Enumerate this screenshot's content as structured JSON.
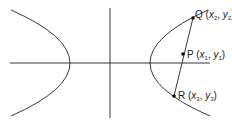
{
  "diagram": {
    "colors": {
      "stroke": "#222222",
      "background": "#ffffff"
    },
    "axes": {
      "x_axis": {
        "x1": 10,
        "y1": 63,
        "x2": 210,
        "y2": 63
      },
      "y_axis": {
        "x1": 110,
        "y1": 8,
        "x2": 110,
        "y2": 118
      }
    },
    "points": [
      {
        "id": "Q",
        "name": "Q",
        "sub_x": "2",
        "sub_y": "2",
        "cx": 193,
        "cy": 18,
        "label_x": 195,
        "label_y": 13
      },
      {
        "id": "P",
        "name": "P",
        "sub_x": "1",
        "sub_y": "1",
        "cx": 183,
        "cy": 54,
        "label_x": 187,
        "label_y": 50
      },
      {
        "id": "R",
        "name": "R",
        "sub_x": "3",
        "sub_y": "3",
        "cx": 174,
        "cy": 96,
        "label_x": 178,
        "label_y": 91
      }
    ],
    "labels": {
      "Q": {
        "letter": "Q",
        "open": " (",
        "x": "x",
        "sx": "2",
        "comma": ", ",
        "y": "y",
        "sy": "2",
        "close": ")"
      },
      "P": {
        "letter": "P",
        "open": " (",
        "x": "x",
        "sx": "1",
        "comma": ", ",
        "y": "y",
        "sy": "1",
        "close": ")"
      },
      "R": {
        "letter": "R",
        "open": " (",
        "x": "x",
        "sx": "3",
        "comma": ", ",
        "y": "y",
        "sy": "3",
        "close": ")"
      }
    }
  }
}
